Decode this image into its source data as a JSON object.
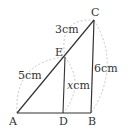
{
  "diagram": {
    "points": {
      "A": {
        "label": "A",
        "x": 17,
        "y": 113
      },
      "D": {
        "label": "D",
        "x": 63,
        "y": 113
      },
      "B": {
        "label": "B",
        "x": 91,
        "y": 113
      },
      "C": {
        "label": "C",
        "x": 94,
        "y": 20
      },
      "E": {
        "label": "E",
        "x": 65,
        "y": 57
      }
    },
    "measures": {
      "AE": "5cm",
      "EC": "3cm",
      "BC": "6cm",
      "DE_var": "x",
      "DE_unit": "cm"
    },
    "colors": {
      "line": "#333333",
      "dashed": "#b0b0b0"
    }
  }
}
